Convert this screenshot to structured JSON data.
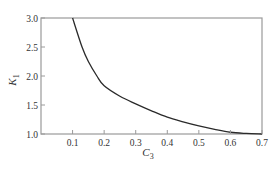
{
  "chart_data": {
    "type": "line",
    "title": "",
    "xlabel": "C",
    "xlabel_sub": "3",
    "ylabel": "K",
    "ylabel_sub": "1",
    "xlim": [
      0.0,
      0.7
    ],
    "ylim": [
      1.0,
      3.0
    ],
    "x_ticks": [
      0.1,
      0.2,
      0.3,
      0.4,
      0.5,
      0.6,
      0.7
    ],
    "x_tick_labels": [
      "0.1",
      "0.2",
      "0.3",
      "0.4",
      "0.5",
      "0.6",
      "0.7"
    ],
    "y_ticks": [
      1.0,
      1.5,
      2.0,
      2.5,
      3.0
    ],
    "y_tick_labels": [
      "1.0",
      "1.5",
      "2.0",
      "2.5",
      "3.0"
    ],
    "grid": false,
    "legend": null,
    "series": [
      {
        "name": "K1 vs C3",
        "x": [
          0.1,
          0.13,
          0.15,
          0.177,
          0.2,
          0.25,
          0.3,
          0.35,
          0.4,
          0.45,
          0.5,
          0.55,
          0.6,
          0.65,
          0.7
        ],
        "y": [
          3.0,
          2.5,
          2.25,
          2.0,
          1.83,
          1.65,
          1.52,
          1.4,
          1.29,
          1.21,
          1.14,
          1.08,
          1.03,
          1.01,
          1.0
        ]
      }
    ]
  },
  "colors": {
    "axis": "#9a9a9a",
    "curve": "#2a2a2a",
    "text": "#333333"
  }
}
